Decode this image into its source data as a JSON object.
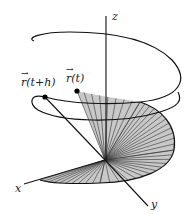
{
  "diagram": {
    "axes": {
      "z_label": "z",
      "x_label": "x",
      "y_label": "y"
    },
    "points": {
      "r_t_label": "r(t)",
      "r_t_plus_h_label": "r(t+h)",
      "vector_arrow": "→"
    },
    "colors": {
      "curve": "#111111",
      "fan_fill": "#c8c8c8",
      "fan_lines": "#333333",
      "background": "#ffffff"
    }
  }
}
